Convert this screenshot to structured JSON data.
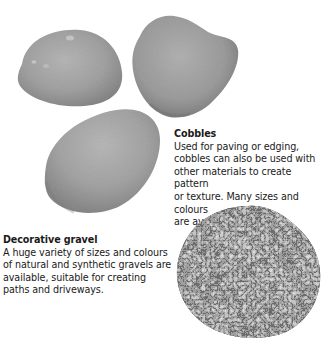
{
  "cobbles": {
    "title": "Cobbles",
    "body": "Used for paving or edging,\ncobbles can also be used with\nother materials to create pattern\nor texture. Many sizes and colours\nare available.",
    "image": "cobble-stones-photo"
  },
  "gravel": {
    "title": "Decorative gravel",
    "body": "A huge variety of sizes and colours\nof natural and synthetic gravels are\navailable, suitable for creating\npaths and driveways.",
    "image": "gravel-pile-photo"
  },
  "colors": {
    "background": "#ffffff",
    "text": "#1a1a1a",
    "stone_light": "#b0b0b0",
    "stone_mid": "#9a9a9a",
    "stone_dark": "#7c7c7c",
    "gravel_dark": "#3c3c3c",
    "gravel_mid": "#6a6a6a",
    "gravel_light": "#9c9c9c"
  }
}
